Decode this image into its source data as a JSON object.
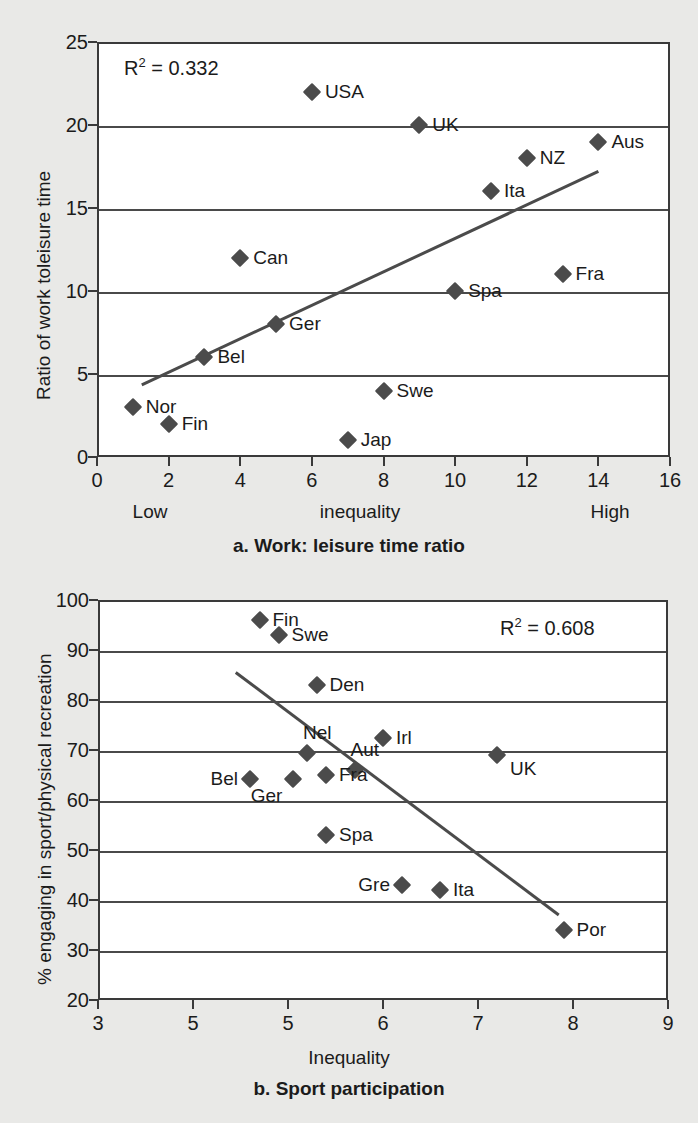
{
  "chart_data": [
    {
      "id": "a",
      "type": "scatter",
      "title": "a. Work: leisure time ratio",
      "xlabel": "inequality",
      "ylabel": "Ratio of work toleisure time",
      "xlim": [
        0,
        16
      ],
      "ylim": [
        0,
        25
      ],
      "xticks": [
        0,
        2,
        4,
        6,
        8,
        10,
        12,
        14,
        16
      ],
      "yticks": [
        0,
        5,
        10,
        15,
        20,
        25
      ],
      "grid": true,
      "annotation": "R² = 0.332",
      "r2": 0.332,
      "x_low_label": "Low",
      "x_high_label": "High",
      "points": [
        {
          "label": "USA",
          "x": 6,
          "y": 22,
          "side": "right"
        },
        {
          "label": "UK",
          "x": 9,
          "y": 20,
          "side": "right"
        },
        {
          "label": "Aus",
          "x": 14,
          "y": 19,
          "side": "right"
        },
        {
          "label": "NZ",
          "x": 12,
          "y": 18,
          "side": "right"
        },
        {
          "label": "Ita",
          "x": 11,
          "y": 16,
          "side": "right"
        },
        {
          "label": "Can",
          "x": 4,
          "y": 12,
          "side": "right"
        },
        {
          "label": "Fra",
          "x": 13,
          "y": 11,
          "side": "right"
        },
        {
          "label": "Spa",
          "x": 10,
          "y": 10,
          "side": "right"
        },
        {
          "label": "Ger",
          "x": 5,
          "y": 8,
          "side": "right"
        },
        {
          "label": "Bel",
          "x": 3,
          "y": 6,
          "side": "right"
        },
        {
          "label": "Swe",
          "x": 8,
          "y": 4,
          "side": "right"
        },
        {
          "label": "Nor",
          "x": 1,
          "y": 3,
          "side": "right"
        },
        {
          "label": "Fin",
          "x": 2,
          "y": 2,
          "side": "right"
        },
        {
          "label": "Jap",
          "x": 7,
          "y": 1,
          "side": "right"
        }
      ],
      "trendline": {
        "x1": 1.25,
        "y1": 4.35,
        "x2": 14.0,
        "y2": 17.2
      }
    },
    {
      "id": "b",
      "type": "scatter",
      "title": "b. Sport participation",
      "xlabel": "Inequality",
      "ylabel": "% engaging in sport/physical recreation",
      "xlim": [
        3,
        9
      ],
      "ylim": [
        20,
        100
      ],
      "xticks": [
        3,
        5,
        5,
        6,
        7,
        8,
        9
      ],
      "yticks": [
        20,
        30,
        40,
        50,
        60,
        70,
        80,
        90,
        100
      ],
      "grid": true,
      "annotation": "R² = 0.608",
      "r2": 0.608,
      "points": [
        {
          "label": "Fin",
          "x": 4.7,
          "y": 96,
          "side": "right"
        },
        {
          "label": "Swe",
          "x": 4.9,
          "y": 93,
          "side": "right"
        },
        {
          "label": "Den",
          "x": 5.3,
          "y": 83,
          "side": "right"
        },
        {
          "label": "Irl",
          "x": 6.0,
          "y": 72.5,
          "side": "right"
        },
        {
          "label": "Nel",
          "x": 5.2,
          "y": 69.5,
          "side": "above"
        },
        {
          "label": "UK",
          "x": 7.2,
          "y": 69,
          "side": "rightlow"
        },
        {
          "label": "Aut",
          "x": 5.7,
          "y": 66,
          "side": "above"
        },
        {
          "label": "Fra",
          "x": 5.4,
          "y": 65,
          "side": "right"
        },
        {
          "label": "Ger",
          "x": 5.05,
          "y": 64.2,
          "side": "below"
        },
        {
          "label": "Bel",
          "x": 4.6,
          "y": 64.2,
          "side": "left"
        },
        {
          "label": "Spa",
          "x": 5.4,
          "y": 53,
          "side": "right"
        },
        {
          "label": "Gre",
          "x": 6.2,
          "y": 43,
          "side": "left"
        },
        {
          "label": "Ita",
          "x": 6.6,
          "y": 42,
          "side": "right"
        },
        {
          "label": "Por",
          "x": 7.9,
          "y": 34,
          "side": "right"
        }
      ],
      "trendline": {
        "x1": 4.45,
        "y1": 85.5,
        "x2": 7.85,
        "y2": 37.0
      }
    }
  ],
  "colors": {
    "background": "#e9e9e7",
    "plot_background": "#ffffff",
    "axis": "#3a3a3a",
    "grid": "#4a4a4a",
    "marker": "#4b4b4b",
    "text": "#1b1b1b"
  }
}
